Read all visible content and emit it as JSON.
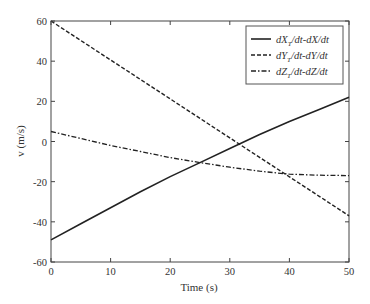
{
  "chart_data": {
    "type": "line",
    "title": "",
    "xlabel": "Time (s)",
    "ylabel": "v (m/s)",
    "xlim": [
      0,
      50
    ],
    "ylim": [
      -60,
      60
    ],
    "xticks": [
      0,
      10,
      20,
      30,
      40,
      50
    ],
    "yticks": [
      -60,
      -40,
      -20,
      0,
      20,
      40,
      60
    ],
    "grid": false,
    "legend_position": "top-right",
    "x": [
      0,
      5,
      10,
      15,
      20,
      25,
      30,
      35,
      40,
      45,
      50
    ],
    "series": [
      {
        "name": "dX_T/dt-dX/dt",
        "label_main": "dX",
        "label_sub": "T",
        "label_rest": "/dt-dX/dt",
        "style": "solid",
        "values": [
          -49,
          -41,
          -33,
          -25,
          -17.5,
          -10.5,
          -3.5,
          3.5,
          10,
          16,
          22
        ]
      },
      {
        "name": "dY_T/dt-dY/dt",
        "label_main": "dY",
        "label_sub": "T",
        "label_rest": "/dt-dY/dt",
        "style": "dashed",
        "values": [
          60,
          50.3,
          40.6,
          30.9,
          21.2,
          11.5,
          1.8,
          -7.9,
          -17.6,
          -27.3,
          -37
        ]
      },
      {
        "name": "dZ_T/dt-dZ/dt",
        "label_main": "dZ",
        "label_sub": "T",
        "label_rest": "/dt-dZ/dt",
        "style": "dashdot",
        "values": [
          5,
          1.5,
          -2,
          -5,
          -8,
          -10.5,
          -12.8,
          -14.8,
          -16.3,
          -16.8,
          -17
        ]
      }
    ]
  }
}
